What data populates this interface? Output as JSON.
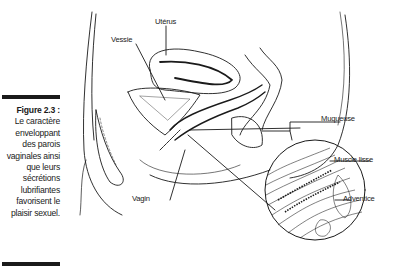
{
  "caption": {
    "figure_number": "Figure 2.3 :",
    "text": "Le caractère enveloppant des parois vaginales ainsi que leurs sécrétions lubrifiantes favorisent le plaisir sexuel."
  },
  "labels": {
    "uterus": "Utérus",
    "bladder": "Vessie",
    "vagina": "Vagin",
    "mucosa": "Muqueuse",
    "smooth_muscle": "Muscle lisse",
    "adventitia": "Adventice"
  },
  "colors": {
    "ink": "#1a1a1a",
    "background": "#ffffff"
  }
}
